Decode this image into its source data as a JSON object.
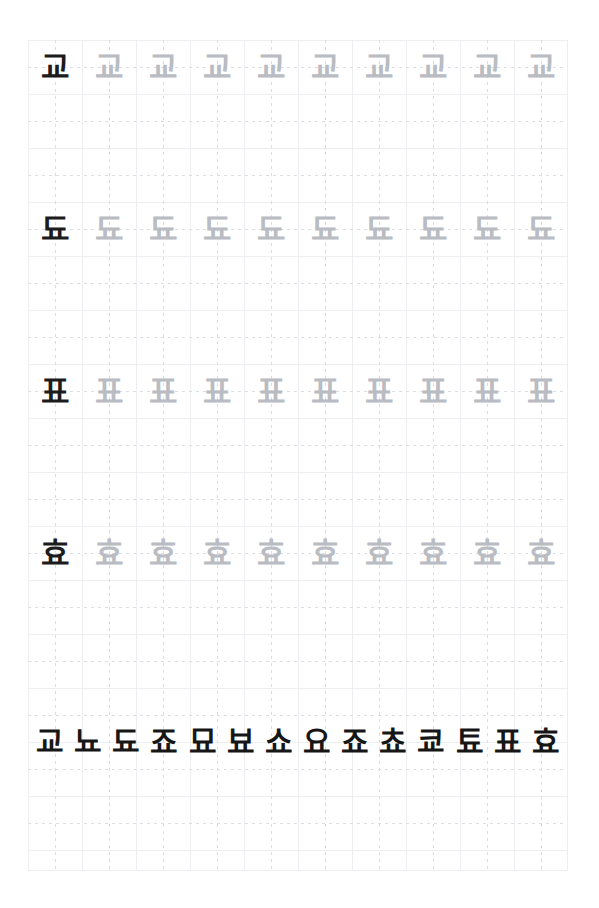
{
  "worksheet": {
    "title": "Korean Hangul Syllable Tracing Worksheet",
    "page_background": "#ffffff",
    "sheet_background": "#ffffff",
    "grid_line_color": "#eceef1",
    "guide_line_color": "#dcdde0",
    "model_ink_color": "#1c1c1c",
    "trace_ink_color": "#b9bcc2",
    "columns": 10,
    "cell_size_px": 54
  },
  "practice_rows": [
    {
      "id": "row-gyo",
      "model": "교",
      "traces": [
        "교",
        "교",
        "교",
        "교",
        "교",
        "교",
        "교",
        "교",
        "교"
      ]
    },
    {
      "id": "row-dyo",
      "model": "됴",
      "traces": [
        "됴",
        "됴",
        "됴",
        "됴",
        "됴",
        "됴",
        "됴",
        "됴",
        "됴"
      ]
    },
    {
      "id": "row-pyo",
      "model": "표",
      "traces": [
        "표",
        "표",
        "표",
        "표",
        "표",
        "표",
        "표",
        "표",
        "표"
      ]
    },
    {
      "id": "row-hyo",
      "model": "효",
      "traces": [
        "효",
        "효",
        "효",
        "효",
        "효",
        "효",
        "효",
        "효",
        "효"
      ]
    }
  ],
  "summary_row": {
    "id": "summary-row",
    "characters": [
      "교",
      "뇨",
      "됴",
      "죠",
      "묘",
      "뵤",
      "쇼",
      "요",
      "죠",
      "쵸",
      "쿄",
      "툐",
      "표",
      "효"
    ]
  }
}
